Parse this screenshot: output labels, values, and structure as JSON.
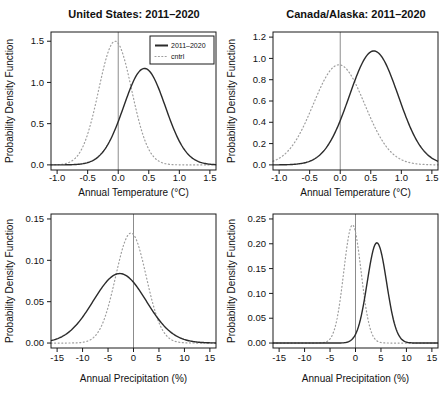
{
  "colors": {
    "background": "#ffffff",
    "axis": "#1a1a1a",
    "text": "#111111",
    "series_current": "#2b2b2b",
    "series_control": "#9e9e9e",
    "reference_line": "#8c8c8c"
  },
  "chart_data": [
    {
      "id": "us-temperature",
      "type": "line",
      "title": "United States: 2011–2020",
      "xlabel": "Annual Temperature (°C)",
      "ylabel": "Probability Density Function",
      "xlim": [
        -1.0,
        1.5
      ],
      "ylim": [
        0,
        1.55
      ],
      "grid": false,
      "vline_x": 0,
      "xticks": [
        {
          "v": -1.0,
          "label": "-1.0"
        },
        {
          "v": -0.5,
          "label": "-0.5"
        },
        {
          "v": 0.0,
          "label": "0.0"
        },
        {
          "v": 0.5,
          "label": "0.5"
        },
        {
          "v": 1.0,
          "label": "1.0"
        },
        {
          "v": 1.5,
          "label": "1.5"
        }
      ],
      "yticks": [
        {
          "v": 0.0,
          "label": "0.0"
        },
        {
          "v": 0.5,
          "label": "0.5"
        },
        {
          "v": 1.0,
          "label": "1.0"
        },
        {
          "v": 1.5,
          "label": "1.5"
        }
      ],
      "legend": {
        "position": "top-right",
        "entries": [
          {
            "label": "2011–2020",
            "series": 0
          },
          {
            "label": "cntrl",
            "series": 1
          }
        ]
      },
      "series": [
        {
          "name": "2011–2020",
          "style": "solid",
          "color": "#2b2b2b",
          "distribution": "gaussian",
          "mean": 0.43,
          "sd": 0.34,
          "peak_density": 1.17
        },
        {
          "name": "cntrl",
          "style": "dotted",
          "color": "#9e9e9e",
          "distribution": "gaussian",
          "mean": -0.05,
          "sd": 0.27,
          "peak_density": 1.5
        }
      ]
    },
    {
      "id": "canada-alaska-temperature",
      "type": "line",
      "title": "Canada/Alaska: 2011–2020",
      "xlabel": "Annual Temperature (°C)",
      "ylabel": "Probability Density Function",
      "xlim": [
        -1.0,
        1.5
      ],
      "ylim": [
        0,
        1.2
      ],
      "grid": false,
      "vline_x": 0,
      "xticks": [
        {
          "v": -1.0,
          "label": "-1.0"
        },
        {
          "v": -0.5,
          "label": "-0.5"
        },
        {
          "v": 0.0,
          "label": "0.0"
        },
        {
          "v": 0.5,
          "label": "0.5"
        },
        {
          "v": 1.0,
          "label": "1.0"
        },
        {
          "v": 1.5,
          "label": "1.5"
        }
      ],
      "yticks": [
        {
          "v": 0.0,
          "label": "0.0"
        },
        {
          "v": 0.2,
          "label": "0.2"
        },
        {
          "v": 0.4,
          "label": "0.4"
        },
        {
          "v": 0.6,
          "label": "0.6"
        },
        {
          "v": 0.8,
          "label": "0.8"
        },
        {
          "v": 1.0,
          "label": "1.0"
        },
        {
          "v": 1.2,
          "label": "1.2"
        }
      ],
      "series": [
        {
          "name": "2011–2020",
          "style": "solid",
          "color": "#2b2b2b",
          "distribution": "gaussian",
          "mean": 0.55,
          "sd": 0.4,
          "peak_density": 1.07
        },
        {
          "name": "cntrl",
          "style": "dotted",
          "color": "#9e9e9e",
          "distribution": "gaussian",
          "mean": -0.02,
          "sd": 0.42,
          "peak_density": 0.94
        }
      ]
    },
    {
      "id": "us-precipitation",
      "type": "line",
      "xlabel": "Annual Precipitation (%)",
      "ylabel": "Probability Density Function",
      "xlim": [
        -15,
        15
      ],
      "ylim": [
        0,
        0.15
      ],
      "grid": false,
      "vline_x": 0,
      "xticks": [
        {
          "v": -15,
          "label": "-15"
        },
        {
          "v": -10,
          "label": "-10"
        },
        {
          "v": -5,
          "label": "-5"
        },
        {
          "v": 0,
          "label": "0"
        },
        {
          "v": 5,
          "label": "5"
        },
        {
          "v": 10,
          "label": "10"
        },
        {
          "v": 15,
          "label": "15"
        }
      ],
      "yticks": [
        {
          "v": 0.0,
          "label": "0.00"
        },
        {
          "v": 0.05,
          "label": "0.05"
        },
        {
          "v": 0.1,
          "label": "0.10"
        },
        {
          "v": 0.15,
          "label": "0.15"
        }
      ],
      "series": [
        {
          "name": "2011–2020",
          "style": "solid",
          "color": "#2b2b2b",
          "distribution": "gaussian",
          "mean": -2.7,
          "sd": 5.2,
          "peak_density": 0.084
        },
        {
          "name": "cntrl",
          "style": "dotted",
          "color": "#9e9e9e",
          "distribution": "gaussian",
          "mean": -0.5,
          "sd": 3.0,
          "peak_density": 0.133
        }
      ]
    },
    {
      "id": "canada-alaska-precipitation",
      "type": "line",
      "xlabel": "Annual Precipitation (%)",
      "ylabel": "Probability Density Function",
      "xlim": [
        -15,
        15
      ],
      "ylim": [
        0,
        0.25
      ],
      "grid": false,
      "vline_x": 0,
      "xticks": [
        {
          "v": -15,
          "label": "-15"
        },
        {
          "v": -10,
          "label": "-10"
        },
        {
          "v": -5,
          "label": "-5"
        },
        {
          "v": 0,
          "label": "0"
        },
        {
          "v": 5,
          "label": "5"
        },
        {
          "v": 10,
          "label": "10"
        },
        {
          "v": 15,
          "label": "15"
        }
      ],
      "yticks": [
        {
          "v": 0.0,
          "label": "0.00"
        },
        {
          "v": 0.05,
          "label": "0.05"
        },
        {
          "v": 0.1,
          "label": "0.10"
        },
        {
          "v": 0.15,
          "label": "0.15"
        },
        {
          "v": 0.2,
          "label": "0.20"
        },
        {
          "v": 0.25,
          "label": "0.25"
        }
      ],
      "series": [
        {
          "name": "2011–2020",
          "style": "solid",
          "color": "#2b2b2b",
          "distribution": "gaussian",
          "mean": 4.2,
          "sd": 1.9,
          "peak_density": 0.202
        },
        {
          "name": "cntrl",
          "style": "dotted",
          "color": "#9e9e9e",
          "distribution": "gaussian",
          "mean": -0.6,
          "sd": 1.7,
          "peak_density": 0.238
        }
      ]
    }
  ]
}
